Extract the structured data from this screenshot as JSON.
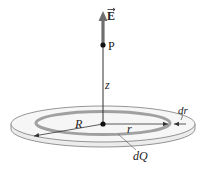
{
  "figure": {
    "labels": {
      "field": "E",
      "point": "P",
      "height": "z",
      "disk_radius": "R",
      "ring_radius": "r",
      "ring_width": "dr",
      "ring_charge": "dQ"
    },
    "colors": {
      "background": "#ffffff",
      "disk_fill": "#f4f4f4",
      "disk_edge": "#7a7a7a",
      "ring": "#9a9a9a",
      "field_arrow": "#6e6e6e",
      "lines": "#333333",
      "dots": "#111111"
    }
  }
}
